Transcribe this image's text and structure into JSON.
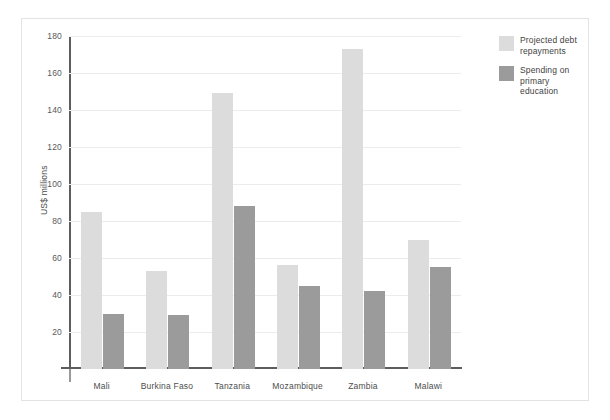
{
  "chart_data": {
    "type": "bar",
    "title": "",
    "subtitle": "",
    "xlabel": "",
    "ylabel": "US$ millions",
    "ylim": [
      0,
      180
    ],
    "ytick_step": 20,
    "yticks": [
      20,
      40,
      60,
      80,
      100,
      120,
      140,
      160,
      180
    ],
    "grid": true,
    "legend_position": "right",
    "categories": [
      "Mali",
      "Burkina Faso",
      "Tanzania",
      "Mozambique",
      "Zambia",
      "Malawi"
    ],
    "series": [
      {
        "name": "Projected debt repayments",
        "color": "#dcdcdc",
        "values": [
          85,
          53,
          149,
          56,
          173,
          70
        ]
      },
      {
        "name": "Spending on primary education",
        "color": "#9b9b9b",
        "values": [
          30,
          29,
          88,
          45,
          42,
          55
        ]
      }
    ]
  },
  "legend": {
    "items": [
      {
        "label": "Projected debt repayments",
        "color": "#dcdcdc"
      },
      {
        "label": "Spending on primary education",
        "color": "#9b9b9b"
      }
    ]
  }
}
